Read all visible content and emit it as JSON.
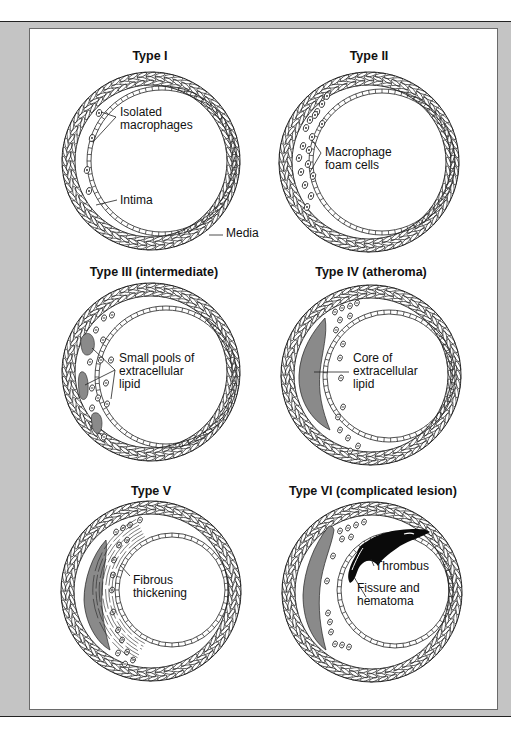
{
  "figure": {
    "colors": {
      "frame": "#c4c4c4",
      "panel": "#ffffff",
      "line": "#222222",
      "lipid": "#8a8a8a",
      "thrombus": "#0a0a0a"
    },
    "panels": [
      {
        "id": "type-1",
        "title": "Type I",
        "title_pos": [
          150,
          60
        ],
        "outer": {
          "cx": 151,
          "cy": 161,
          "r": 89
        },
        "lumen": {
          "cx": 162,
          "cy": 161,
          "r": 72
        },
        "labels": [
          {
            "lines": [
              "Isolated",
              "macrophages"
            ],
            "x": 120,
            "y": 116,
            "name": "label-isolated-macrophages"
          },
          {
            "lines": [
              "Intima"
            ],
            "x": 120,
            "y": 204,
            "name": "label-intima"
          },
          {
            "lines": [
              "Media"
            ],
            "x": 226,
            "y": 237,
            "name": "label-media"
          }
        ]
      },
      {
        "id": "type-2",
        "title": "Type II",
        "title_pos": [
          369,
          60
        ],
        "outer": {
          "cx": 369,
          "cy": 162,
          "r": 90
        },
        "lumen": {
          "cx": 382,
          "cy": 162,
          "r": 70
        },
        "labels": [
          {
            "lines": [
              "Macrophage",
              "foam cells"
            ],
            "x": 325,
            "y": 156,
            "name": "label-macrophage-foam-cells"
          }
        ]
      },
      {
        "id": "type-3",
        "title": "Type III (intermediate)",
        "title_pos": [
          154,
          276
        ],
        "outer": {
          "cx": 151,
          "cy": 372,
          "r": 89
        },
        "lumen": {
          "cx": 166,
          "cy": 377,
          "r": 68
        },
        "labels": [
          {
            "lines": [
              "Small pools of",
              "extracellular",
              "lipid"
            ],
            "x": 119,
            "y": 362,
            "name": "label-small-pools-of-extracellular-lipid"
          }
        ]
      },
      {
        "id": "type-4",
        "title": "Type IV (atheroma)",
        "title_pos": [
          371,
          276
        ],
        "outer": {
          "cx": 371,
          "cy": 375,
          "r": 90
        },
        "lumen": {
          "cx": 389,
          "cy": 376,
          "r": 63
        },
        "labels": [
          {
            "lines": [
              "Core of",
              "extracellular",
              "lipid"
            ],
            "x": 353,
            "y": 362,
            "name": "label-core-of-extracellular-lipid"
          }
        ]
      },
      {
        "id": "type-5",
        "title": "Type V",
        "title_pos": [
          151,
          495
        ],
        "outer": {
          "cx": 151,
          "cy": 591,
          "r": 90
        },
        "lumen": {
          "cx": 172,
          "cy": 590,
          "r": 54
        },
        "labels": [
          {
            "lines": [
              "Fibrous",
              "thickening"
            ],
            "x": 133,
            "y": 584,
            "name": "label-fibrous-thickening"
          }
        ]
      },
      {
        "id": "type-6",
        "title": "Type VI (complicated lesion)",
        "title_pos": [
          373,
          495
        ],
        "outer": {
          "cx": 372,
          "cy": 592,
          "r": 90
        },
        "lumen": {
          "cx": 395,
          "cy": 590,
          "r": 55
        },
        "labels": [
          {
            "lines": [
              "Thrombus"
            ],
            "x": 375,
            "y": 570,
            "name": "label-thrombus"
          },
          {
            "lines": [
              "Fissure and",
              "hematoma"
            ],
            "x": 357,
            "y": 592,
            "name": "label-fissure-and-hematoma"
          }
        ]
      }
    ]
  }
}
